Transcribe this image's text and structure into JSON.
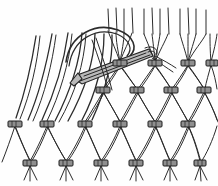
{
  "figure": {
    "title": "Netting mesh with netting needle",
    "technique": "knotted diamond mesh netting",
    "background_color": "#fefefe",
    "cord_color": "#2b2b2b",
    "knot_fill_color": "#8f8f8f",
    "knot_outline_color": "#1d1d1d",
    "needle_fill_color": "#b9b9b9",
    "needle_outline_color": "#242424"
  },
  "canvas": {
    "width": 218,
    "height": 186
  },
  "mesh": {
    "description": "diamond mesh net formed by rows of offset knots joined by paired curved cords",
    "knot_rows": [
      {
        "name": "row-1-top",
        "y": 63,
        "knot_count": 4,
        "x_positions": [
          120,
          155,
          188,
          210
        ],
        "label": "top knot row"
      },
      {
        "name": "row-2",
        "y": 90,
        "knot_count": 5,
        "x_positions": [
          103,
          137,
          171,
          204,
          215
        ],
        "label": "second knot row"
      },
      {
        "name": "row-3",
        "y": 124,
        "knot_count": 6,
        "x_positions": [
          15,
          47,
          85,
          120,
          155,
          188
        ],
        "label": "third knot row"
      },
      {
        "name": "row-4-bottom",
        "y": 163,
        "knot_count": 6,
        "x_positions": [
          30,
          66,
          101,
          136,
          170,
          200
        ],
        "label": "bottom knot row"
      }
    ],
    "knot_shape": "small dark flattened rectangle where four cords converge",
    "knot_width": 13,
    "knot_height": 6,
    "mesh_openings": "elongated vertical diamonds / lens shapes",
    "cord_pairs_per_leg": 2
  },
  "loose_strands": {
    "description": "unknotted warp cords hanging free on the left side of the work",
    "count": 7,
    "region": "left portion above the third knot row",
    "top_x_positions": [
      36,
      52,
      68,
      82,
      95,
      104,
      112
    ],
    "bottom_x_positions": [
      14,
      26,
      40,
      53,
      66,
      80,
      92
    ]
  },
  "top_fringe": {
    "description": "short cord ends standing up above the top knot row",
    "count": 12,
    "x_positions": [
      108,
      116,
      124,
      132,
      144,
      152,
      160,
      168,
      180,
      188,
      196,
      206
    ],
    "top_y": 8,
    "bottom_y": 30
  },
  "bottom_tails": {
    "description": "short cord tails below the bottom row of knots",
    "per_knot": 3,
    "length": 14
  },
  "needle": {
    "name": "netting-needle",
    "description": "elongated netting needle/shuttle threaded with cord, drawn passing diagonally across the upper mesh",
    "tip_point": [
      74,
      78
    ],
    "tail_point": [
      148,
      54
    ],
    "loop_description": "cord loop curving up and over from the needle across the top knot row",
    "visible": true
  },
  "guide_cord": {
    "description": "working cord looping from the needle over the top of the mesh",
    "visible": true
  }
}
